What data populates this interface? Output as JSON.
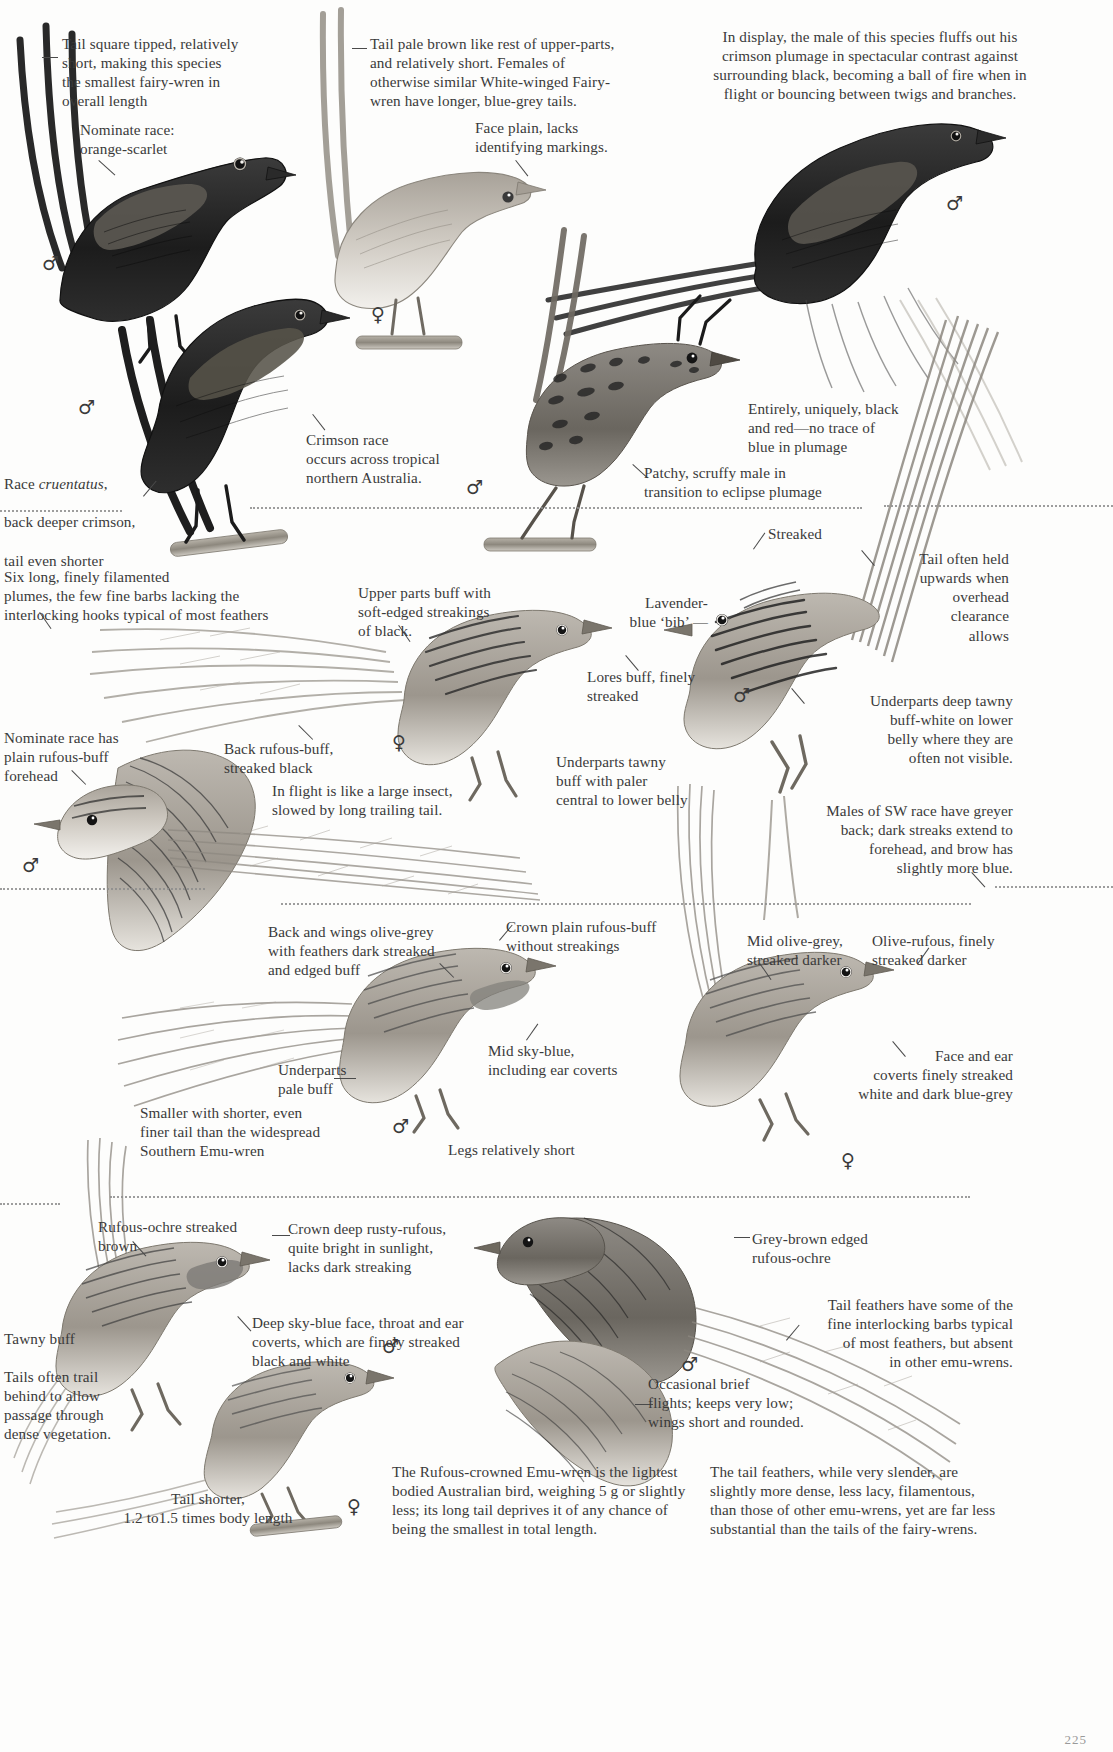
{
  "page": {
    "kind": "field-guide-plate",
    "page_number": "225"
  },
  "symbols": {
    "male": "♂",
    "female": "♀"
  },
  "captions": [
    {
      "id": "tail-square-tipped",
      "text": "Tail square tipped, relatively\nshort, making this species\nthe smallest fairy-wren in\noverall length",
      "align": "left",
      "x": 62,
      "y": 34,
      "w": 250
    },
    {
      "id": "nominate-race-orange-scarlet",
      "text": "Nominate race:\norange-scarlet",
      "align": "left",
      "x": 80,
      "y": 120,
      "w": 190
    },
    {
      "id": "tail-pale-brown",
      "text": "Tail pale brown like rest of upper-parts,\nand relatively short. Females of\notherwise similar White-winged Fairy-\nwren have longer, blue-grey tails.",
      "align": "left",
      "x": 370,
      "y": 34,
      "w": 250
    },
    {
      "id": "face-plain",
      "text": "Face plain, lacks\nidentifying markings.",
      "align": "left",
      "x": 475,
      "y": 118,
      "w": 190
    },
    {
      "id": "in-display-male",
      "text": "In display, the male of this species fluffs out his\ncrimson plumage in spectacular contrast against\nsurrounding black, becoming a ball of fire when in\nflight or bouncing between twigs and branches.",
      "align": "center",
      "x": 660,
      "y": 27,
      "w": 420
    },
    {
      "id": "race-cruentatus",
      "text": "Race cruentatus,\nback deeper crimson,\ntail even shorter",
      "align": "left",
      "italic_words": "cruentatus",
      "x": 4,
      "y": 455,
      "w": 200
    },
    {
      "id": "crimson-race-tropical",
      "text": "Crimson race\noccurs across tropical\nnorthern Australia.",
      "align": "left",
      "x": 306,
      "y": 430,
      "w": 215
    },
    {
      "id": "entirely-black-red",
      "text": "Entirely, uniquely, black\nand red—no trace of\nblue in plumage",
      "align": "left",
      "x": 748,
      "y": 399,
      "w": 220
    },
    {
      "id": "patchy-scruffy",
      "text": "Patchy, scruffy male in\ntransition to eclipse plumage",
      "align": "left",
      "x": 644,
      "y": 463,
      "w": 260
    },
    {
      "id": "six-long-plumes",
      "text": "Six long, finely filamented\nplumes, the few fine barbs lacking the\ninterlocking hooks typical of most feathers",
      "align": "left",
      "x": 4,
      "y": 567,
      "w": 340
    },
    {
      "id": "upper-parts-buff",
      "text": "Upper parts buff with\nsoft-edged streakings\nof black.",
      "align": "left",
      "x": 358,
      "y": 583,
      "w": 200
    },
    {
      "id": "streaked",
      "text": "Streaked",
      "align": "left",
      "x": 768,
      "y": 524,
      "w": 100
    },
    {
      "id": "lavender-blue-bib",
      "text": "Lavender-\nblue ‘bib’ —",
      "align": "right",
      "x": 596,
      "y": 593,
      "w": 110
    },
    {
      "id": "tail-often-held-upwards",
      "text": "Tail often held\nupwards when\noverhead\nclearance\nallows",
      "align": "right",
      "x": 872,
      "y": 549,
      "w": 137
    },
    {
      "id": "lores-buff",
      "text": "Lores buff, finely\nstreaked",
      "align": "left",
      "x": 587,
      "y": 667,
      "w": 160
    },
    {
      "id": "underparts-deep-tawny",
      "text": "Underparts deep tawny\nbuff-white on lower\nbelly where they are\noften not visible.",
      "align": "right",
      "x": 800,
      "y": 691,
      "w": 213
    },
    {
      "id": "back-rufous-buff",
      "text": "Back rufous-buff,\nstreaked black",
      "align": "left",
      "x": 224,
      "y": 739,
      "w": 170
    },
    {
      "id": "nominate-race-plain-forehead",
      "text": "Nominate race has\nplain rufous-buff\nforehead",
      "align": "left",
      "x": 4,
      "y": 728,
      "w": 165
    },
    {
      "id": "underparts-tawny-buff",
      "text": "Underparts tawny\nbuff with paler\ncentral to lower belly",
      "align": "left",
      "x": 556,
      "y": 752,
      "w": 200
    },
    {
      "id": "in-flight-large-insect",
      "text": "In flight is like a large insect,\nslowed by long trailing tail.",
      "align": "left",
      "x": 272,
      "y": 781,
      "w": 250
    },
    {
      "id": "males-sw-race",
      "text": "Males of SW race have greyer\nback; dark streaks extend to\nforehead, and brow has\nslightly more blue.",
      "align": "right",
      "x": 788,
      "y": 801,
      "w": 225
    },
    {
      "id": "back-wings-olive-grey",
      "text": "Back and wings olive-grey\nwith feathers dark streaked\nand edged buff",
      "align": "left",
      "x": 268,
      "y": 922,
      "w": 230
    },
    {
      "id": "crown-plain-rufous-buff",
      "text": "Crown plain rufous-buff\nwithout streakings",
      "align": "left",
      "x": 506,
      "y": 917,
      "w": 210
    },
    {
      "id": "mid-olive-grey",
      "text": "Mid olive-grey,\nstreaked darker",
      "align": "left",
      "x": 747,
      "y": 931,
      "w": 150
    },
    {
      "id": "olive-rufous",
      "text": "Olive-rufous, finely\nstreaked darker",
      "align": "left",
      "x": 872,
      "y": 931,
      "w": 165
    },
    {
      "id": "mid-sky-blue",
      "text": "Mid sky-blue,\nincluding ear coverts",
      "align": "left",
      "x": 488,
      "y": 1041,
      "w": 185
    },
    {
      "id": "underparts-pale-buff",
      "text": "Underparts\npale buff",
      "align": "left",
      "x": 278,
      "y": 1060,
      "w": 110
    },
    {
      "id": "face-ear-coverts-streaked",
      "text": "Face and ear\ncoverts finely streaked\nwhite and dark blue-grey",
      "align": "right",
      "x": 810,
      "y": 1046,
      "w": 203
    },
    {
      "id": "smaller-shorter-tail",
      "text": "Smaller with shorter, even\nfiner tail than the widespread\nSouthern Emu-wren",
      "align": "left",
      "x": 140,
      "y": 1103,
      "w": 235
    },
    {
      "id": "legs-relatively-short",
      "text": "Legs relatively short",
      "align": "left",
      "x": 448,
      "y": 1140,
      "w": 180
    },
    {
      "id": "rufous-ochre-streaked",
      "text": "Rufous-ochre streaked\nbrown",
      "align": "left",
      "x": 98,
      "y": 1217,
      "w": 190
    },
    {
      "id": "crown-deep-rusty-rufous",
      "text": "Crown deep rusty-rufous,\nquite bright in sunlight,\nlacks dark streaking",
      "align": "left",
      "x": 288,
      "y": 1219,
      "w": 215
    },
    {
      "id": "grey-brown-edged",
      "text": "Grey-brown edged\nrufous-ochre",
      "align": "left",
      "x": 752,
      "y": 1229,
      "w": 175
    },
    {
      "id": "deep-sky-blue-face",
      "text": "Deep sky-blue face, throat and ear\ncoverts, which are finely streaked\nblack and white",
      "align": "left",
      "x": 252,
      "y": 1313,
      "w": 275
    },
    {
      "id": "tail-feathers-interlocking",
      "text": "Tail feathers have some of the\nfine interlocking barbs typical\nof most feathers, but absent\nin other emu-wrens.",
      "align": "right",
      "x": 800,
      "y": 1295,
      "w": 213
    },
    {
      "id": "tawny-buff",
      "text": "Tawny buff",
      "align": "left",
      "x": 4,
      "y": 1329,
      "w": 120
    },
    {
      "id": "tails-often-trail",
      "text": "Tails often trail\nbehind to allow\npassage through\ndense vegetation.",
      "align": "left",
      "x": 4,
      "y": 1367,
      "w": 145
    },
    {
      "id": "occasional-brief-flights",
      "text": "Occasional brief\nflights; keeps very low;\nwings short and rounded.",
      "align": "left",
      "x": 648,
      "y": 1374,
      "w": 225
    },
    {
      "id": "tail-shorter",
      "text": "Tail shorter,\n1.2 to1.5 times body length",
      "align": "center",
      "x": 88,
      "y": 1489,
      "w": 240
    },
    {
      "id": "rufous-crowned-lightest",
      "text": "The Rufous-crowned Emu-wren is the lightest\nbodied Australian bird, weighing 5 g or slightly\nless; its long tail deprives it of any chance of\nbeing the smallest in total length.",
      "align": "left",
      "x": 392,
      "y": 1462,
      "w": 300
    },
    {
      "id": "tail-feathers-slender",
      "text": "The tail feathers, while very slender, are\nslightly more dense, less lacy, filamentous,\nthan those of other emu-wrens, yet are far less\nsubstantial than the tails of the fairy-wrens.",
      "align": "left",
      "x": 710,
      "y": 1462,
      "w": 305
    }
  ],
  "sex_marks": [
    {
      "id": "male-red-backed-left",
      "symbol": "♂",
      "x": 42,
      "y": 254
    },
    {
      "id": "female-white-winged",
      "symbol": "♀",
      "x": 371,
      "y": 305
    },
    {
      "id": "male-crimson-display",
      "symbol": "♂",
      "x": 946,
      "y": 194
    },
    {
      "id": "male-cruentatus",
      "symbol": "♂",
      "x": 78,
      "y": 398
    },
    {
      "id": "male-eclipse",
      "symbol": "♂",
      "x": 466,
      "y": 478
    },
    {
      "id": "female-rufous-crowned",
      "symbol": "♀",
      "x": 392,
      "y": 733
    },
    {
      "id": "male-mallee-emu-wren",
      "symbol": "♂",
      "x": 733,
      "y": 686
    },
    {
      "id": "male-flight-emu-wren",
      "symbol": "♂",
      "x": 22,
      "y": 856
    },
    {
      "id": "male-southern-emu-wren",
      "symbol": "♂",
      "x": 392,
      "y": 1117
    },
    {
      "id": "female-southern-emu-wren",
      "symbol": "♀",
      "x": 841,
      "y": 1151
    },
    {
      "id": "male-rufous-crowned-2",
      "symbol": "♂",
      "x": 382,
      "y": 1337
    },
    {
      "id": "male-flight-rufous",
      "symbol": "♂",
      "x": 681,
      "y": 1355
    },
    {
      "id": "female-bottom",
      "symbol": "♀",
      "x": 347,
      "y": 1497
    }
  ],
  "separators": [
    {
      "id": "sep-band-1-left",
      "x": 0,
      "y": 510,
      "w": 122
    },
    {
      "id": "sep-band-1-right",
      "x": 250,
      "y": 507,
      "w": 612
    },
    {
      "id": "sep-band-1-far",
      "x": 884,
      "y": 505,
      "w": 229
    },
    {
      "id": "sep-band-2-left",
      "x": 0,
      "y": 888,
      "w": 205
    },
    {
      "id": "sep-band-2-right",
      "x": 281,
      "y": 903,
      "w": 690
    },
    {
      "id": "sep-band-2-far",
      "x": 995,
      "y": 886,
      "w": 118
    },
    {
      "id": "sep-band-3-left",
      "x": 0,
      "y": 1203,
      "w": 60
    },
    {
      "id": "sep-band-3-right",
      "x": 110,
      "y": 1196,
      "w": 860
    }
  ],
  "leaders": [
    {
      "id": "leader-tail-square",
      "x": 42,
      "y": 57,
      "len": 16,
      "rot": 0
    },
    {
      "id": "leader-nominate-race",
      "x": 99,
      "y": 160,
      "len": 22,
      "rot": 42
    },
    {
      "id": "leader-tail-pale-brown",
      "x": 352,
      "y": 48,
      "len": 15,
      "rot": 0
    },
    {
      "id": "leader-face-plain",
      "x": 516,
      "y": 160,
      "len": 20,
      "rot": 52
    },
    {
      "id": "leader-cruentatus",
      "x": 143,
      "y": 496,
      "len": 20,
      "rot": -50
    },
    {
      "id": "leader-crimson-race",
      "x": 313,
      "y": 414,
      "len": 20,
      "rot": 52
    },
    {
      "id": "leader-patchy",
      "x": 633,
      "y": 464,
      "len": 20,
      "rot": 42
    },
    {
      "id": "leader-six-plumes",
      "x": 40,
      "y": 612,
      "len": 20,
      "rot": 55
    },
    {
      "id": "leader-upper-parts",
      "x": 399,
      "y": 625,
      "len": 20,
      "rot": 55
    },
    {
      "id": "leader-streaked",
      "x": 753,
      "y": 549,
      "len": 20,
      "rot": -55
    },
    {
      "id": "leader-tail-upwards",
      "x": 862,
      "y": 550,
      "len": 20,
      "rot": 50
    },
    {
      "id": "leader-underparts-tawny",
      "x": 792,
      "y": 688,
      "len": 20,
      "rot": 50
    },
    {
      "id": "leader-lores",
      "x": 626,
      "y": 655,
      "len": 20,
      "rot": 50
    },
    {
      "id": "leader-nominate-fore",
      "x": 72,
      "y": 770,
      "len": 20,
      "rot": 45
    },
    {
      "id": "leader-back-rufous",
      "x": 299,
      "y": 725,
      "len": 20,
      "rot": 45
    },
    {
      "id": "leader-males-sw",
      "x": 972,
      "y": 872,
      "len": 20,
      "rot": 48
    },
    {
      "id": "leader-back-wings",
      "x": 440,
      "y": 963,
      "len": 20,
      "rot": 45
    },
    {
      "id": "leader-crown-plain",
      "x": 499,
      "y": 940,
      "len": 20,
      "rot": -50
    },
    {
      "id": "leader-mid-sky-blue",
      "x": 526,
      "y": 1040,
      "len": 20,
      "rot": -55
    },
    {
      "id": "leader-underparts-pale",
      "x": 334,
      "y": 1078,
      "len": 22,
      "rot": 0
    },
    {
      "id": "leader-face-ear",
      "x": 893,
      "y": 1041,
      "len": 20,
      "rot": 50
    },
    {
      "id": "leader-mid-olive",
      "x": 760,
      "y": 963,
      "len": 20,
      "rot": 55
    },
    {
      "id": "leader-olive-rufous",
      "x": 917,
      "y": 964,
      "len": 20,
      "rot": -55
    },
    {
      "id": "leader-rufous-ochre",
      "x": 133,
      "y": 1241,
      "len": 20,
      "rot": 48
    },
    {
      "id": "leader-crown-deep",
      "x": 272,
      "y": 1235,
      "len": 18,
      "rot": 0
    },
    {
      "id": "leader-grey-brown",
      "x": 734,
      "y": 1237,
      "len": 16,
      "rot": 0
    },
    {
      "id": "leader-deep-sky-blue",
      "x": 238,
      "y": 1316,
      "len": 20,
      "rot": 48
    },
    {
      "id": "leader-tail-interlock",
      "x": 786,
      "y": 1340,
      "len": 20,
      "rot": -50
    },
    {
      "id": "leader-occasional",
      "x": 635,
      "y": 1404,
      "len": 18,
      "rot": 0
    }
  ],
  "figures": [
    {
      "id": "red-backed-fairy-wren-male-nominate",
      "label": "Red-backed Fairy-wren male, nominate race"
    },
    {
      "id": "white-winged-fairy-wren-female",
      "label": "White-winged Fairy-wren female"
    },
    {
      "id": "red-backed-fairy-wren-male-display",
      "label": "Red-backed Fairy-wren male in display"
    },
    {
      "id": "red-backed-fairy-wren-male-cruentatus",
      "label": "Red-backed Fairy-wren male, race cruentatus"
    },
    {
      "id": "red-backed-fairy-wren-male-eclipse",
      "label": "Red-backed Fairy-wren male, eclipse plumage"
    },
    {
      "id": "rufous-crowned-emu-wren-female",
      "label": "Rufous-crowned Emu-wren female"
    },
    {
      "id": "mallee-emu-wren-male",
      "label": "Mallee Emu-wren male"
    },
    {
      "id": "emu-wren-in-flight",
      "label": "Emu-wren in flight"
    },
    {
      "id": "southern-emu-wren-male",
      "label": "Southern Emu-wren male"
    },
    {
      "id": "southern-emu-wren-female",
      "label": "Southern Emu-wren female"
    },
    {
      "id": "rufous-crowned-emu-wren-male",
      "label": "Rufous-crowned Emu-wren male"
    },
    {
      "id": "rufous-crowned-emu-wren-flight",
      "label": "Rufous-crowned Emu-wren in flight"
    },
    {
      "id": "rufous-crowned-emu-wren-female-2",
      "label": "Rufous-crowned Emu-wren female"
    }
  ]
}
